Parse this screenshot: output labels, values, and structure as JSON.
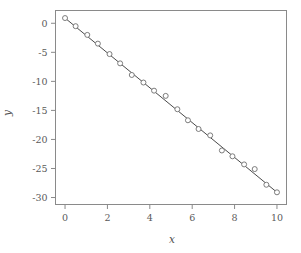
{
  "chart_data": {
    "type": "scatter",
    "title": "",
    "subtitle": "",
    "xlabel": "x",
    "ylabel": "y",
    "xlim": [
      -0.45,
      10.45
    ],
    "ylim": [
      -31.2,
      2.2
    ],
    "xticks": [
      0,
      2,
      4,
      6,
      8,
      10
    ],
    "xtick_labels": [
      "0",
      "2",
      "4",
      "6",
      "8",
      "10"
    ],
    "yticks": [
      0,
      -5,
      -10,
      -15,
      -20,
      -25,
      -30
    ],
    "ytick_labels": [
      "0",
      "-5",
      "-10",
      "-15",
      "-20",
      "-25",
      "-30"
    ],
    "grid": false,
    "legend": "none",
    "marker": "open-circle",
    "marker_size": 5,
    "frame": true,
    "tick_direction": "out",
    "colors": {
      "frame": "#8a8a8a",
      "marker_edge": "#6e6e6e",
      "marker_face": "#ffffff",
      "fit_line": "#4a4a4a",
      "background": "#ffffff",
      "text": "#4f4f4f"
    },
    "series": [
      {
        "name": "data",
        "type": "scatter",
        "x": [
          0.0,
          0.5,
          1.05,
          1.55,
          2.1,
          2.6,
          3.15,
          3.7,
          4.2,
          4.75,
          5.3,
          5.8,
          6.3,
          6.85,
          7.4,
          7.9,
          8.45,
          8.95,
          9.5,
          10.0
        ],
        "y": [
          0.9,
          -0.5,
          -2.0,
          -3.5,
          -5.3,
          -6.9,
          -8.9,
          -10.2,
          -11.6,
          -12.5,
          -14.8,
          -16.7,
          -18.2,
          -19.3,
          -21.9,
          -22.9,
          -24.3,
          -25.1,
          -27.8,
          -29.1
        ]
      },
      {
        "name": "fit",
        "type": "line",
        "x": [
          0.0,
          10.0
        ],
        "y": [
          0.9,
          -29.1
        ]
      }
    ],
    "fit": {
      "intercept": 0.9,
      "slope": -3.0,
      "equation": "y = 0.9 - 3.0x"
    }
  }
}
